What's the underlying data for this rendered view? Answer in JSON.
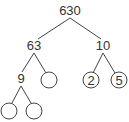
{
  "diagram": {
    "type": "factor-tree",
    "nodes": {
      "root": {
        "label": "630"
      },
      "left": {
        "label": "63"
      },
      "right": {
        "label": "10"
      },
      "left_left": {
        "label": "9"
      },
      "left_right": {
        "label": ""
      },
      "right_left": {
        "label": "2"
      },
      "right_right": {
        "label": "5"
      },
      "ll_left": {
        "label": ""
      },
      "ll_right": {
        "label": ""
      }
    },
    "edges": [
      [
        "630",
        "63"
      ],
      [
        "630",
        "10"
      ],
      [
        "63",
        "9"
      ],
      [
        "63",
        "blank"
      ],
      [
        "10",
        "2"
      ],
      [
        "10",
        "5"
      ],
      [
        "9",
        "blank"
      ],
      [
        "9",
        "blank"
      ]
    ]
  }
}
